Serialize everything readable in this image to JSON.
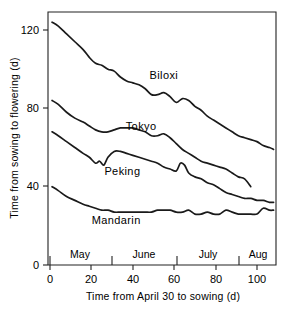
{
  "chart_data": {
    "type": "line",
    "title": "",
    "xlabel": "Time from April 30 to sowing (d)",
    "ylabel": "Time from sowing to flowering (d)",
    "xlim": [
      0,
      110
    ],
    "ylim": [
      0,
      130
    ],
    "xticks": [
      0,
      20,
      40,
      60,
      80,
      100
    ],
    "yticks": [
      0,
      40,
      80,
      120
    ],
    "grid": false,
    "legend_position": "inline-annotations",
    "month_axis": {
      "label": "months of sowing",
      "boundaries": [
        1,
        31,
        62,
        92,
        110
      ],
      "labels": [
        "May",
        "June",
        "July",
        "Aug"
      ]
    },
    "series": [
      {
        "name": "Biloxi",
        "label_x": 55,
        "label_y": 95,
        "x": [
          1,
          4,
          8,
          12,
          16,
          19,
          22,
          25,
          28,
          31,
          34,
          37,
          40,
          43,
          46,
          49,
          52,
          55,
          58,
          61,
          64,
          67,
          70,
          73,
          76,
          79,
          82,
          85,
          88,
          91,
          94,
          97,
          100,
          103,
          106,
          108
        ],
        "y": [
          124,
          122,
          118,
          114,
          110,
          106,
          103,
          102,
          100,
          99,
          96,
          94,
          93,
          92,
          90,
          87,
          87,
          88,
          86,
          83,
          85,
          84,
          81,
          79,
          76,
          74,
          72,
          70,
          68,
          66,
          65,
          64,
          63,
          61,
          60,
          59
        ]
      },
      {
        "name": "Tokyo",
        "label_x": 44,
        "label_y": 69,
        "x": [
          1,
          4,
          8,
          12,
          16,
          19,
          22,
          25,
          28,
          31,
          34,
          37,
          40,
          43,
          46,
          49,
          52,
          55,
          58,
          61,
          64,
          67,
          70,
          73,
          76,
          79,
          82,
          85,
          88,
          91,
          94,
          97
        ],
        "y": [
          84,
          82,
          78,
          75,
          73,
          71,
          69,
          68,
          68,
          69,
          70,
          70,
          70,
          69,
          68,
          66,
          66,
          67,
          65,
          62,
          59,
          57,
          55,
          53,
          52,
          51,
          50,
          49,
          47,
          45,
          44,
          40
        ]
      },
      {
        "name": "Peking",
        "label_x": 35,
        "label_y": 46,
        "x": [
          1,
          4,
          8,
          12,
          16,
          19,
          22,
          24,
          26,
          28,
          31,
          34,
          37,
          40,
          43,
          46,
          49,
          52,
          55,
          58,
          61,
          63,
          65,
          67,
          70,
          73,
          76,
          79,
          82,
          85,
          88,
          91,
          94,
          97,
          100,
          103,
          106,
          108
        ],
        "y": [
          68,
          66,
          63,
          60,
          57,
          55,
          52,
          53,
          51,
          55,
          58,
          58,
          57,
          56,
          55,
          54,
          53,
          52,
          50,
          49,
          48,
          52,
          51,
          47,
          45,
          44,
          42,
          41,
          39,
          37,
          36,
          35,
          34,
          34,
          33,
          33,
          32,
          32
        ]
      },
      {
        "name": "Mandarin",
        "label_x": 32,
        "label_y": 21,
        "x": [
          1,
          4,
          8,
          12,
          16,
          19,
          22,
          25,
          28,
          31,
          34,
          37,
          40,
          43,
          46,
          49,
          52,
          55,
          58,
          61,
          64,
          67,
          70,
          73,
          76,
          79,
          82,
          85,
          88,
          91,
          94,
          97,
          100,
          103,
          106,
          108
        ],
        "y": [
          40,
          38,
          35,
          33,
          31,
          30,
          29,
          28,
          28,
          27,
          27,
          27,
          27,
          27,
          27,
          27,
          28,
          28,
          28,
          27,
          27,
          28,
          26,
          26,
          27,
          26,
          26,
          28,
          27,
          26,
          26,
          26,
          26,
          29,
          28,
          28
        ]
      }
    ]
  },
  "axes": {
    "y_tick_labels": [
      "120",
      "80",
      "40",
      "0"
    ],
    "x_tick_labels": [
      "0",
      "20",
      "40",
      "60",
      "80",
      "100"
    ],
    "y_axis_title": "Time from sowing to flowering (d)",
    "x_axis_title": "Time from April 30 to sowing (d)"
  },
  "months": [
    "May",
    "June",
    "July",
    "Aug"
  ],
  "series_labels": [
    "Biloxi",
    "Tokyo",
    "Peking",
    "Mandarin"
  ],
  "colors": {
    "line": "#1a1a1a",
    "axis": "#222222",
    "background": "#ffffff",
    "text": "#000000"
  }
}
